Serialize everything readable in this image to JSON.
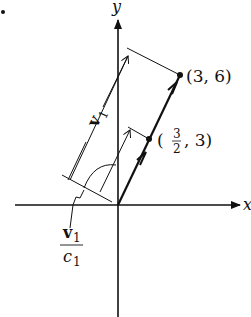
{
  "figure": {
    "bullet": "•",
    "axes": {
      "x_label": "x",
      "y_label": "y"
    },
    "points": [
      {
        "label": "(3, 6)",
        "x": 3,
        "y": 6
      },
      {
        "label_open": "(",
        "label_num": "3",
        "label_den": "2",
        "label_close": ", 3)",
        "x": 1.5,
        "y": 3
      }
    ],
    "dimension_label": {
      "vector": "v",
      "subscript": "1"
    },
    "scaled_label": {
      "numerator_vector": "v",
      "numerator_sub": "1",
      "denominator": "c",
      "denominator_sub": "1"
    },
    "colors": {
      "ink": "#111111",
      "background": "#ffffff"
    }
  }
}
